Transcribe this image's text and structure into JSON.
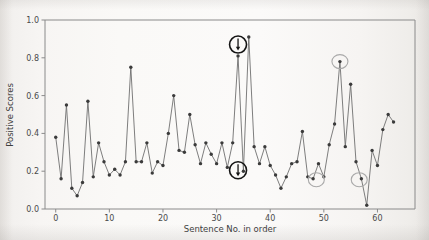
{
  "chart_data": {
    "type": "line",
    "title": "",
    "xlabel": "Sentence No. in order",
    "ylabel": "Positive Scores",
    "xlim": [
      -2,
      67
    ],
    "ylim": [
      0.0,
      1.0
    ],
    "grid": false,
    "legend": "none",
    "marker": "filled-circle",
    "xticks": [
      0,
      10,
      20,
      30,
      40,
      50,
      60
    ],
    "xtick_labels": [
      "0",
      "10",
      "20",
      "30",
      "40",
      "50",
      "60"
    ],
    "yticks": [
      0.0,
      0.2,
      0.4,
      0.6,
      0.8,
      1.0
    ],
    "ytick_labels": [
      "0.0",
      "0.2",
      "0.4",
      "0.6",
      "0.8",
      "1.0"
    ],
    "series": [
      {
        "name": "Positive Scores",
        "color": "#6f6f6f",
        "x": [
          0,
          1,
          2,
          3,
          4,
          5,
          6,
          7,
          8,
          9,
          10,
          11,
          12,
          13,
          14,
          15,
          16,
          17,
          18,
          19,
          20,
          21,
          22,
          23,
          24,
          25,
          26,
          27,
          28,
          29,
          30,
          31,
          32,
          33,
          34,
          35,
          36,
          37,
          38,
          39,
          40,
          41,
          42,
          43,
          44,
          45,
          46,
          47,
          48,
          49,
          50,
          51,
          52,
          53,
          54,
          55,
          56,
          57,
          58,
          59,
          60,
          61,
          62,
          63
        ],
        "values": [
          0.38,
          0.16,
          0.55,
          0.11,
          0.07,
          0.14,
          0.57,
          0.17,
          0.35,
          0.25,
          0.18,
          0.21,
          0.18,
          0.25,
          0.75,
          0.25,
          0.25,
          0.35,
          0.19,
          0.25,
          0.23,
          0.4,
          0.6,
          0.31,
          0.3,
          0.5,
          0.34,
          0.24,
          0.35,
          0.29,
          0.24,
          0.35,
          0.22,
          0.35,
          0.81,
          0.2,
          0.91,
          0.33,
          0.24,
          0.33,
          0.23,
          0.18,
          0.11,
          0.17,
          0.24,
          0.25,
          0.41,
          0.17,
          0.16,
          0.24,
          0.17,
          0.34,
          0.45,
          0.78,
          0.33,
          0.66,
          0.25,
          0.16,
          0.02,
          0.31,
          0.23,
          0.42,
          0.5,
          0.46
        ]
      }
    ],
    "annotations": [
      {
        "name": "high-point-callout",
        "style": "strong",
        "shape": "circle-with-down-arrow",
        "x": 34,
        "y": 0.87,
        "note": "bold black circle with downward arrow above the 0.81 spike"
      },
      {
        "name": "low-point-callout",
        "style": "strong",
        "shape": "circle-with-down-arrow",
        "x": 34,
        "y": 0.205,
        "note": "bold black circle with downward arrow at the 0.20 dip"
      },
      {
        "name": "peak-highlight",
        "style": "light",
        "shape": "ellipse",
        "x": 53,
        "y": 0.78,
        "note": "light gray ellipse around 0.78 peak"
      },
      {
        "name": "dip-highlight-left",
        "style": "light",
        "shape": "ellipse",
        "x": 48.6,
        "y": 0.155,
        "note": "light gray ellipse around 0.16 dip"
      },
      {
        "name": "dip-highlight-right",
        "style": "light",
        "shape": "ellipse",
        "x": 56.6,
        "y": 0.155,
        "note": "light gray ellipse around 0.16 dip"
      }
    ]
  },
  "figure": {
    "background_color": "#f7f5f3",
    "axis_color": "#8a8a8a",
    "line_color": "#6f6f6f",
    "marker_color": "#3b3b3b",
    "annotation_strong_color": "#141414",
    "annotation_light_color": "#a9a9a9"
  }
}
